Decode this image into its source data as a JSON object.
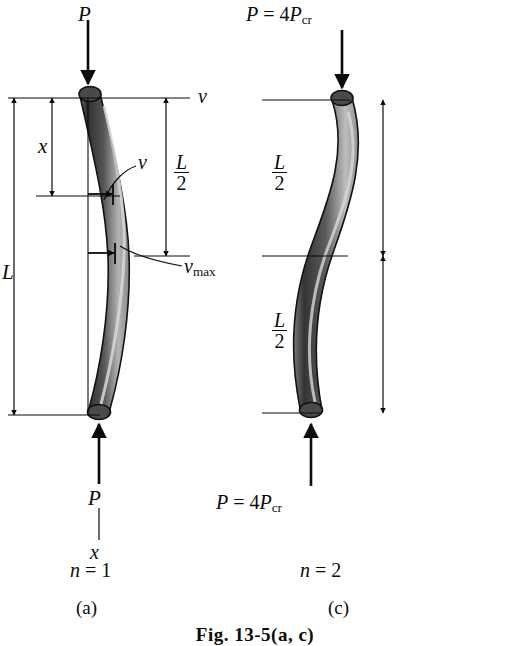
{
  "figure": {
    "caption": "Fig. 13-5(a, c)",
    "type": "engineering-diagram"
  },
  "panel_a": {
    "panel_label": "(a)",
    "mode_label_n": "n",
    "mode_label_eq": "=",
    "mode_label_value": "1",
    "load_top": "P",
    "load_bottom": "P",
    "axis_v": "v",
    "axis_x_bottom": "x",
    "dim_x": "x",
    "dim_L": "L",
    "dim_half_num": "L",
    "dim_half_den": "2",
    "deflection_v": "v",
    "deflection_vmax_base": "v",
    "deflection_vmax_sub": "max"
  },
  "panel_c": {
    "panel_label": "(c)",
    "mode_label_n": "n",
    "mode_label_eq": "=",
    "mode_label_value": "2",
    "load_top_p": "P",
    "load_top_eq": "=",
    "load_top_coeff": "4",
    "load_top_pcr": "P",
    "load_top_sub": "cr",
    "load_bottom_p": "P",
    "load_bottom_eq": "=",
    "load_bottom_coeff": "4",
    "load_bottom_pcr": "P",
    "load_bottom_sub": "cr",
    "dim_upper_num": "L",
    "dim_upper_den": "2",
    "dim_lower_num": "L",
    "dim_lower_den": "2"
  },
  "colors": {
    "ink": "#0b0b0b",
    "column_dark": "#2b2b2b",
    "column_mid": "#6e6e6e",
    "column_light": "#c9c9c9",
    "background": "#ffffff"
  }
}
